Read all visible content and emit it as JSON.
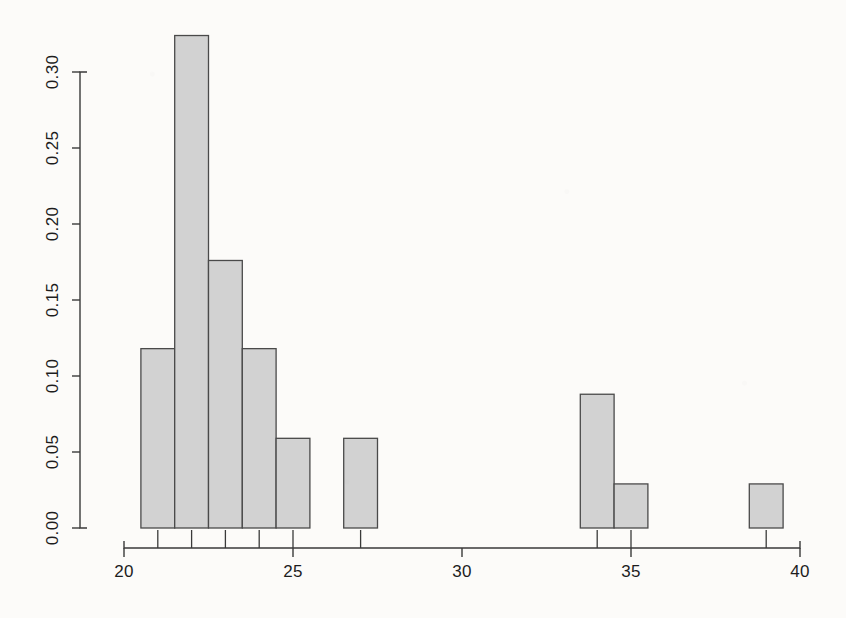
{
  "chart_data": {
    "type": "bar",
    "subtype": "histogram",
    "title": "",
    "subtitle": "",
    "xlabel": "",
    "ylabel": "",
    "xlim": [
      20,
      40
    ],
    "ylim": [
      0.0,
      0.3
    ],
    "grid": false,
    "legend": null,
    "bin_width": 1,
    "bin_edges": [
      20.5,
      21.5,
      22.5,
      23.5,
      24.5,
      25.5,
      26.5,
      27.5,
      33.5,
      34.5,
      35.5,
      38.5,
      39.5
    ],
    "categories": [
      "20.5-21.5",
      "21.5-22.5",
      "22.5-23.5",
      "23.5-24.5",
      "24.5-25.5",
      "26.5-27.5",
      "33.5-34.5",
      "34.5-35.5",
      "38.5-39.5"
    ],
    "bins": [
      {
        "left": 20.5,
        "right": 21.5,
        "mid": 21.0,
        "density": 0.118
      },
      {
        "left": 21.5,
        "right": 22.5,
        "mid": 22.0,
        "density": 0.324
      },
      {
        "left": 22.5,
        "right": 23.5,
        "mid": 23.0,
        "density": 0.176
      },
      {
        "left": 23.5,
        "right": 24.5,
        "mid": 24.0,
        "density": 0.118
      },
      {
        "left": 24.5,
        "right": 25.5,
        "mid": 25.0,
        "density": 0.059
      },
      {
        "left": 26.5,
        "right": 27.5,
        "mid": 27.0,
        "density": 0.059
      },
      {
        "left": 33.5,
        "right": 34.5,
        "mid": 34.0,
        "density": 0.088
      },
      {
        "left": 34.5,
        "right": 35.5,
        "mid": 35.0,
        "density": 0.029
      },
      {
        "left": 38.5,
        "right": 39.5,
        "mid": 39.0,
        "density": 0.029
      }
    ],
    "values": [
      0.118,
      0.324,
      0.176,
      0.118,
      0.059,
      0.059,
      0.088,
      0.029,
      0.029
    ],
    "rug_positions": [
      21.0,
      22.0,
      23.0,
      24.0,
      25.0,
      27.0,
      34.0,
      35.0,
      39.0
    ],
    "x_ticks": [
      {
        "value": 20,
        "label": "20"
      },
      {
        "value": 25,
        "label": "25"
      },
      {
        "value": 30,
        "label": "30"
      },
      {
        "value": 35,
        "label": "35"
      },
      {
        "value": 40,
        "label": "40"
      }
    ],
    "y_ticks": [
      {
        "value": 0.0,
        "label": "0.00"
      },
      {
        "value": 0.05,
        "label": "0.05"
      },
      {
        "value": 0.1,
        "label": "0.10"
      },
      {
        "value": 0.15,
        "label": "0.15"
      },
      {
        "value": 0.2,
        "label": "0.20"
      },
      {
        "value": 0.25,
        "label": "0.25"
      },
      {
        "value": 0.3,
        "label": "0.30"
      }
    ],
    "colors": {
      "bar_fill": "#d2d2d2",
      "bar_border": "#4a4a4a",
      "axis": "#3a3a3a",
      "text": "#1d1d1d",
      "background": "#fcfbf9"
    }
  }
}
